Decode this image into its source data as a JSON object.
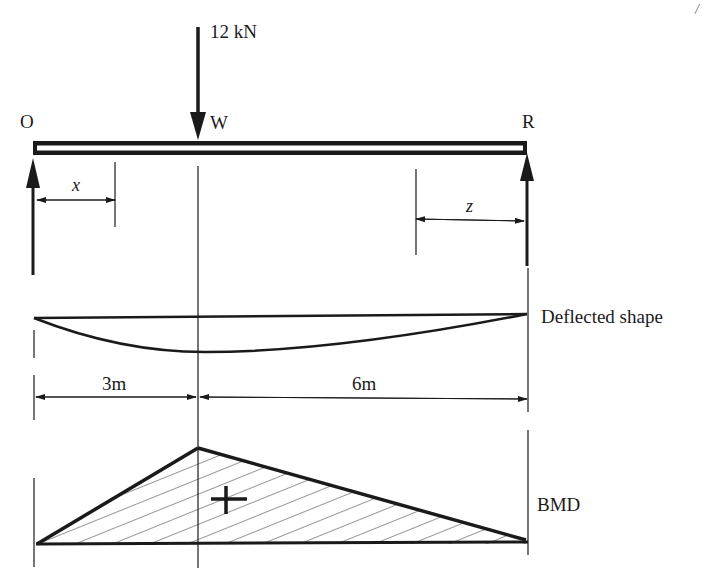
{
  "diagram": {
    "load": {
      "label": "12 kN",
      "point_label": "W",
      "magnitude_kN": 12
    },
    "supports": {
      "left_label": "O",
      "right_label": "R"
    },
    "section_markers": {
      "left": "x",
      "right": "z"
    },
    "spans": {
      "left": "3m",
      "right": "6m"
    },
    "deflected_shape_label": "Deflected shape",
    "bmd_label": "BMD",
    "bmd_sign": "+",
    "corner_mark": "/",
    "colors": {
      "ink": "#1a1a1a",
      "background": "#ffffff"
    }
  }
}
